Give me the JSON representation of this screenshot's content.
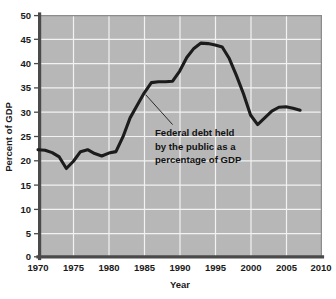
{
  "chart_data": {
    "type": "line",
    "title": "",
    "subtitle": "",
    "xlabel": "Year",
    "ylabel": "Percent of GDP",
    "xlim": [
      1970,
      2010
    ],
    "ylim": [
      0,
      50
    ],
    "xticks": [
      "1970",
      "1975",
      "1980",
      "1985",
      "1990",
      "1995",
      "2000",
      "2005",
      "2010"
    ],
    "yticks": [
      "0",
      "5",
      "10",
      "15",
      "20",
      "25",
      "30",
      "35",
      "40",
      "45",
      "50"
    ],
    "grid": true,
    "legend": "none",
    "annotations": [
      {
        "name": "series-callout",
        "lines": [
          "Federal debt held",
          "by the public as a",
          "percentage of GDP"
        ],
        "leader_from": [
          1985.2,
          33.6
        ],
        "leader_to": [
          1989.0,
          27.4
        ]
      }
    ],
    "series": [
      {
        "name": "Federal debt held by the public as a percentage of GDP",
        "color": "#1c1c1c",
        "x": [
          1970,
          1971,
          1972,
          1973,
          1974,
          1975,
          1976,
          1977,
          1978,
          1979,
          1980,
          1981,
          1982,
          1983,
          1984,
          1985,
          1986,
          1987,
          1988,
          1989,
          1990,
          1991,
          1992,
          1993,
          1994,
          1995,
          1996,
          1997,
          1998,
          1999,
          2000,
          2001,
          2002,
          2003,
          2004,
          2005,
          2006,
          2007
        ],
        "values": [
          22.2,
          22.1,
          21.6,
          20.7,
          18.3,
          19.8,
          21.8,
          22.2,
          21.4,
          20.9,
          21.5,
          21.8,
          24.9,
          28.8,
          31.4,
          34.0,
          36.1,
          36.3,
          36.3,
          36.4,
          38.5,
          41.3,
          43.2,
          44.3,
          44.2,
          43.9,
          43.5,
          41.1,
          37.6,
          33.8,
          29.4,
          27.4,
          28.8,
          30.2,
          31.0,
          31.1,
          30.8,
          30.4
        ]
      }
    ]
  }
}
